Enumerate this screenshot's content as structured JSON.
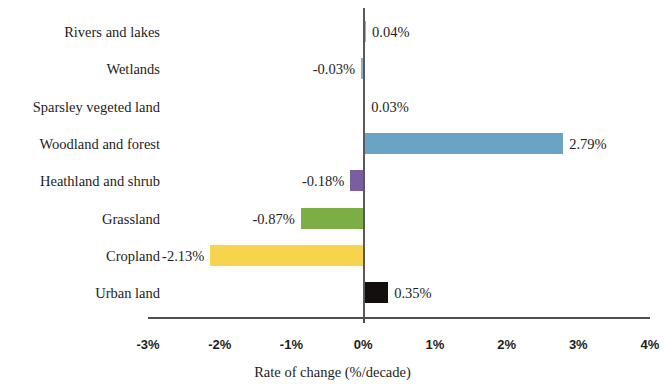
{
  "chart_data": {
    "type": "bar",
    "orientation": "horizontal",
    "title": "",
    "xlabel": "Rate of change (%/decade)",
    "ylabel": "",
    "xlim": [
      -3,
      4
    ],
    "xticks": [
      "-3%",
      "-2%",
      "-1%",
      "0%",
      "1%",
      "2%",
      "3%",
      "4%"
    ],
    "xtick_values": [
      -3,
      -2,
      -1,
      0,
      1,
      2,
      3,
      4
    ],
    "grid": false,
    "legend": "none",
    "categories": [
      "Rivers and lakes",
      "Wetlands",
      "Sparsley vegeted land",
      "Woodland and forest",
      "Heathland and shrub",
      "Grassland",
      "Cropland",
      "Urban land"
    ],
    "values": [
      0.04,
      -0.03,
      0.03,
      2.79,
      -0.18,
      -0.87,
      -2.13,
      0.35
    ],
    "data_labels": [
      "0.04%",
      "-0.03%",
      "0.03%",
      "2.79%",
      "-0.18%",
      "-0.87%",
      "-2.13%",
      "0.35%"
    ],
    "colors": [
      "#C8A278",
      "#8FAFC6",
      "#D2954B",
      "#6BA3C4",
      "#7B5EA0",
      "#7DAE46",
      "#F7D44D",
      "#120F0C"
    ]
  },
  "bars": [
    {
      "label": "Rivers and lakes",
      "value": 0.04,
      "data_label": "0.04%",
      "color": "#C8A278"
    },
    {
      "label": "Wetlands",
      "value": -0.03,
      "data_label": "-0.03%",
      "color": "#8FAFC6"
    },
    {
      "label": "Sparsley vegeted land",
      "value": 0.03,
      "data_label": "0.03%",
      "color": "#D2954B"
    },
    {
      "label": "Woodland and forest",
      "value": 2.79,
      "data_label": "2.79%",
      "color": "#6BA3C4"
    },
    {
      "label": "Heathland and shrub",
      "value": -0.18,
      "data_label": "-0.18%",
      "color": "#7B5EA0"
    },
    {
      "label": "Grassland",
      "value": -0.87,
      "data_label": "-0.87%",
      "color": "#7DAE46"
    },
    {
      "label": "Cropland",
      "value": -2.13,
      "data_label": "-2.13%",
      "color": "#F7D44D"
    },
    {
      "label": "Urban land",
      "value": 0.35,
      "data_label": "0.35%",
      "color": "#120F0C"
    }
  ],
  "axis": {
    "title": "Rate of change (%/decade)",
    "ticks": [
      "-3%",
      "-2%",
      "-1%",
      "0%",
      "1%",
      "2%",
      "3%",
      "4%"
    ]
  }
}
